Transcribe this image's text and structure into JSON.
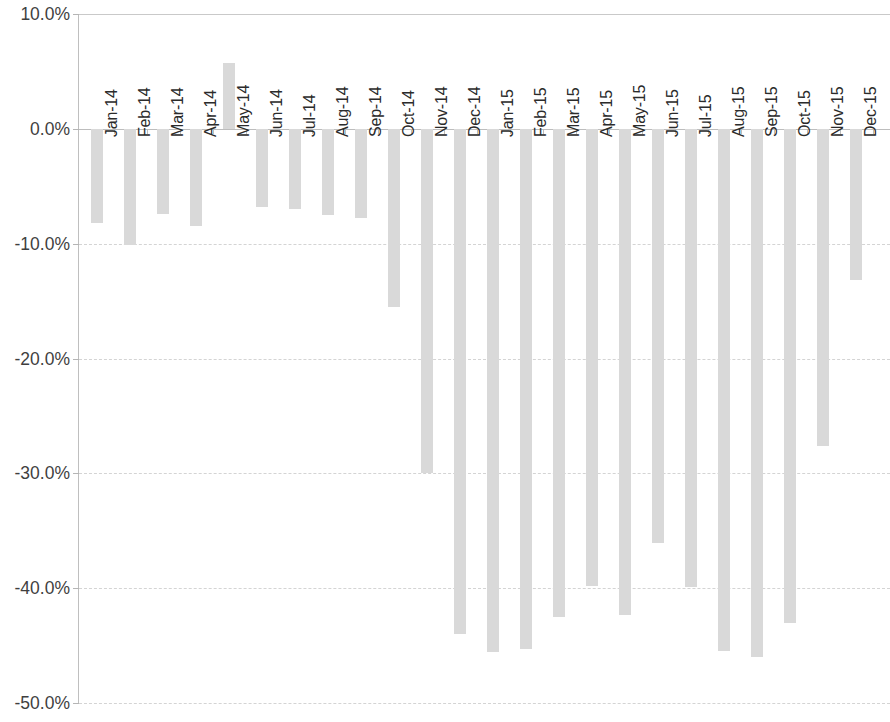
{
  "chart_data": {
    "type": "bar",
    "title": "",
    "subtitle": "",
    "xlabel": "",
    "ylabel": "",
    "ylim": [
      -50.0,
      10.0
    ],
    "y_tick_labels": [
      "10.0%",
      "0.0%",
      "-10.0%",
      "-20.0%",
      "-30.0%",
      "-40.0%",
      "-50.0%"
    ],
    "y_tick_values": [
      10.0,
      0.0,
      -10.0,
      -20.0,
      -30.0,
      -40.0,
      -50.0
    ],
    "grid": true,
    "legend": "none",
    "value_suffix": "%",
    "bar_color": "#d9d9d9",
    "categories": [
      "Jan-14",
      "Feb-14",
      "Mar-14",
      "Apr-14",
      "May-14",
      "Jun-14",
      "Jul-14",
      "Aug-14",
      "Sep-14",
      "Oct-14",
      "Nov-14",
      "Dec-14",
      "Jan-15",
      "Feb-15",
      "Mar-15",
      "Apr-15",
      "May-15",
      "Jun-15",
      "Jul-15",
      "Aug-15",
      "Sep-15",
      "Oct-15",
      "Nov-15",
      "Dec-15"
    ],
    "values": [
      -8.2,
      -10.1,
      -7.4,
      -8.5,
      5.7,
      -6.8,
      -7.0,
      -7.5,
      -7.8,
      -15.5,
      -30.0,
      -44.0,
      -45.6,
      -45.3,
      -42.5,
      -39.8,
      -42.3,
      -36.1,
      -39.9,
      -45.5,
      -46.0,
      -43.0,
      -27.6,
      -13.2
    ]
  }
}
